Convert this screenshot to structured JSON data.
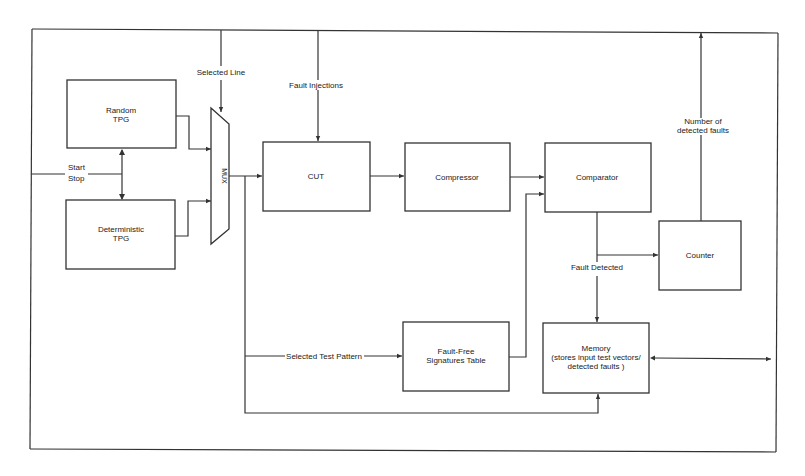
{
  "diagram": {
    "blocks": {
      "random_tpg": {
        "line1": "Random",
        "line2": "TPG"
      },
      "deterministic_tpg": {
        "line1": "Deterministic",
        "line2": "TPG"
      },
      "mux": {
        "label": "MUX"
      },
      "cut": {
        "label": "CUT"
      },
      "compressor": {
        "label": "Compressor"
      },
      "comparator": {
        "label": "Comparator"
      },
      "counter": {
        "label": "Counter"
      },
      "signatures_table": {
        "line1": "Fault-Free",
        "line2": "Signatures Table"
      },
      "memory": {
        "line1": "Memory",
        "line2": "(stores input test vectors/",
        "line3": "detected faults )"
      }
    },
    "signals": {
      "selected_line": "Selected Line",
      "fault_injections": "Fault Injections",
      "start": "Start",
      "stop": "Stop",
      "number_of_detected_faults_1": "Number of",
      "number_of_detected_faults_2": "detected faults",
      "fault_detected": "Fault Detected",
      "selected_test_pattern": "Selected Test Pattern"
    },
    "colors": {
      "line": "#333333",
      "background": "#ffffff"
    }
  }
}
